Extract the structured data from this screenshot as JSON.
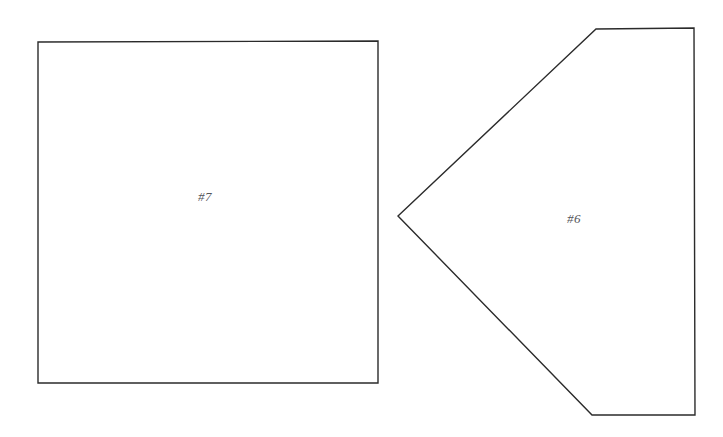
{
  "page": {
    "background_color": "#ffffff",
    "width": 723,
    "height": 437,
    "stroke_color": "#2b2b2b",
    "label_color": "#55555a"
  },
  "shapes": [
    {
      "id": "shape-7",
      "label": "#7",
      "kind": "quadrilateral",
      "label_x": 205,
      "label_y": 197,
      "points": "38,42 378,41 378,383 38,383"
    },
    {
      "id": "shape-6",
      "label": "#6",
      "kind": "hexagon",
      "label_x": 574,
      "label_y": 219,
      "points": "398,216 596,29 694,28 695,415 592,415"
    }
  ]
}
